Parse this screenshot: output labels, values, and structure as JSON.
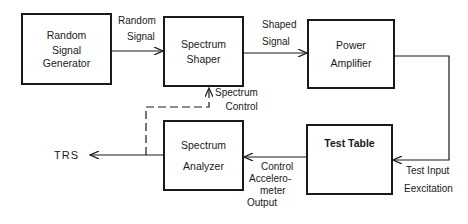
{
  "blocks": {
    "random_signal_generator": [
      "Random",
      "Signal",
      "Generator"
    ],
    "spectrum_shaper": [
      "Spectrum",
      "Shaper"
    ],
    "power_amplifier": [
      "Power",
      "Amplifier"
    ],
    "test_table": [
      "Test Table"
    ],
    "spectrum_analyzer": [
      "Spectrum",
      "Analyzer"
    ]
  },
  "edge_labels": {
    "random_signal": [
      "Random",
      "Signal"
    ],
    "shaped_signal": [
      "Shaped",
      "Signal"
    ],
    "spectrum_control": [
      "Spectrum",
      "Control"
    ],
    "test_input": [
      "Test Input",
      "Eexcitation"
    ],
    "control_accel": [
      "Control",
      "Accelero-",
      "meter",
      "Output"
    ],
    "trs": "TRS"
  },
  "colors": {
    "ink": "#1a1a1a",
    "background": "#ffffff"
  }
}
